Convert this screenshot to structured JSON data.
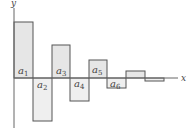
{
  "diagram": {
    "axes": {
      "x_label": "x",
      "y_label": "y"
    },
    "colors": {
      "rect_fill": "#e6e6e6",
      "rect_stroke": "#555555",
      "axis": "#666666",
      "background": "#ffffff"
    },
    "rectangles": [
      {
        "label": "a",
        "sub": "1",
        "sign": "positive",
        "x": 14,
        "y": 22,
        "w": 19,
        "h": 56
      },
      {
        "label": "a",
        "sub": "2",
        "sign": "negative",
        "x": 33,
        "y": 78,
        "w": 19,
        "h": 43
      },
      {
        "label": "a",
        "sub": "3",
        "sign": "positive",
        "x": 52,
        "y": 45,
        "w": 18,
        "h": 33
      },
      {
        "label": "a",
        "sub": "4",
        "sign": "negative",
        "x": 70,
        "y": 78,
        "w": 19,
        "h": 23
      },
      {
        "label": "a",
        "sub": "5",
        "sign": "positive",
        "x": 89,
        "y": 60,
        "w": 18,
        "h": 18
      },
      {
        "label": "a",
        "sub": "6",
        "sign": "negative",
        "x": 107,
        "y": 78,
        "w": 19,
        "h": 10
      },
      {
        "label": "",
        "sub": "",
        "sign": "positive",
        "x": 126,
        "y": 71,
        "w": 19,
        "h": 7
      },
      {
        "label": "",
        "sub": "",
        "sign": "negative",
        "x": 145,
        "y": 78,
        "w": 19,
        "h": 3
      }
    ],
    "labels": {
      "a1": {
        "base": "a",
        "sub": "1"
      },
      "a2": {
        "base": "a",
        "sub": "2"
      },
      "a3": {
        "base": "a",
        "sub": "3"
      },
      "a4": {
        "base": "a",
        "sub": "4"
      },
      "a5": {
        "base": "a",
        "sub": "5"
      },
      "a6": {
        "base": "a",
        "sub": "6"
      }
    }
  }
}
